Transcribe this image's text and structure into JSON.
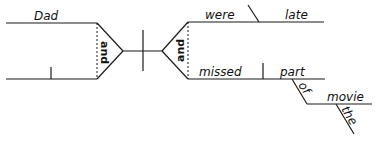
{
  "diagram": {
    "type": "sentence-diagram",
    "sentence_words": {
      "subject_1": "Dad",
      "subject_2": "I",
      "subject_conjunction": "and",
      "predicate_conjunction": "and",
      "verb_1": "were",
      "predicate_adjective": "late",
      "verb_2": "missed",
      "direct_object": "part",
      "preposition": "of",
      "object_of_preposition": "movie",
      "article": "the"
    }
  }
}
